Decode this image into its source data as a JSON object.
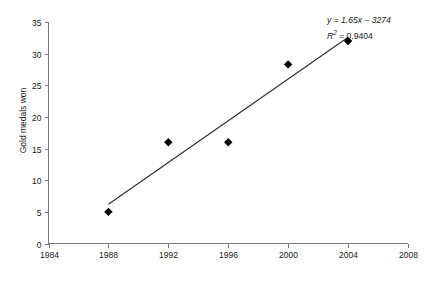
{
  "chart_data": {
    "type": "scatter",
    "title": "",
    "xlabel": "",
    "ylabel": "Gold medals won",
    "x": [
      1988,
      1992,
      1996,
      2000,
      2004
    ],
    "values": [
      5,
      16,
      16,
      28.3,
      32
    ],
    "points": [
      {
        "x": 1988,
        "y": 5
      },
      {
        "x": 1992,
        "y": 16
      },
      {
        "x": 1996,
        "y": 16
      },
      {
        "x": 2000,
        "y": 28.3
      },
      {
        "x": 2004,
        "y": 32
      }
    ],
    "xlim": [
      1984,
      2008
    ],
    "ylim": [
      0,
      35
    ],
    "xticks": [
      "1984",
      "1988",
      "1992",
      "1996",
      "2000",
      "2004",
      "2008"
    ],
    "yticks": [
      "0",
      "5",
      "10",
      "15",
      "20",
      "25",
      "30",
      "35"
    ],
    "grid": false,
    "legend": "none",
    "marker_style": "diamond",
    "marker_color": "#000000",
    "trendline": {
      "type": "linear",
      "slope": 1.65,
      "intercept": -3274,
      "x_start": 1988,
      "x_end": 2004,
      "color": "#2b2b2b"
    },
    "annotations": {
      "equation": "y = 1.65x – 3274",
      "r_squared_prefix": "R",
      "r_squared_exponent": "2",
      "r_squared_value": " = 0.9404"
    }
  },
  "axes": {
    "y_axis_title": "Gold medals won"
  }
}
